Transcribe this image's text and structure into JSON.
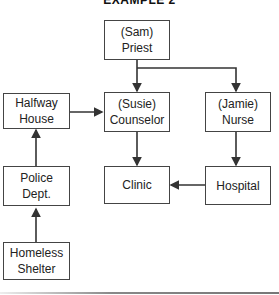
{
  "title": "EXAMPLE 2",
  "nodes": {
    "priest": {
      "line1": "(Sam)",
      "line2": "Priest"
    },
    "halfway": {
      "line1": "Halfway",
      "line2": "House"
    },
    "counselor": {
      "line1": "(Susie)",
      "line2": "Counselor"
    },
    "nurse": {
      "line1": "(Jamie)",
      "line2": "Nurse"
    },
    "police": {
      "line1": "Police",
      "line2": "Dept."
    },
    "clinic": {
      "line1": "Clinic"
    },
    "hospital": {
      "line1": "Hospital"
    },
    "homeless": {
      "line1": "Homeless",
      "line2": "Shelter"
    }
  },
  "edges": [
    {
      "from": "Priest",
      "to": "Counselor"
    },
    {
      "from": "Priest",
      "to": "Nurse"
    },
    {
      "from": "Halfway House",
      "to": "Counselor"
    },
    {
      "from": "Counselor",
      "to": "Clinic"
    },
    {
      "from": "Nurse",
      "to": "Hospital"
    },
    {
      "from": "Hospital",
      "to": "Clinic"
    },
    {
      "from": "Police Dept.",
      "to": "Halfway House"
    },
    {
      "from": "Homeless Shelter",
      "to": "Police Dept."
    }
  ]
}
